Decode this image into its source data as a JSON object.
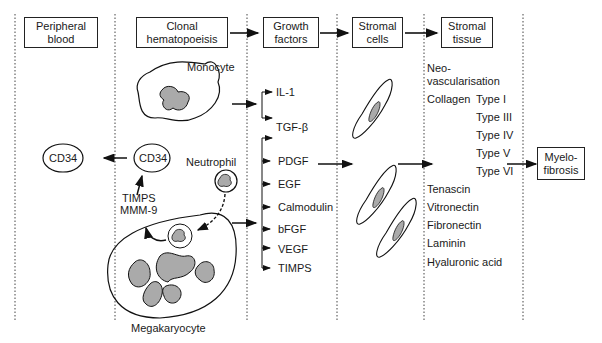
{
  "headers": [
    {
      "id": "peripheral-blood",
      "line1": "Peripheral",
      "line2": "blood"
    },
    {
      "id": "clonal-hematopoeisis",
      "line1": "Clonal",
      "line2": "hematopoeisis"
    },
    {
      "id": "growth-factors",
      "line1": "Growth",
      "line2": "factors"
    },
    {
      "id": "stromal-cells",
      "line1": "Stromal",
      "line2": "cells"
    },
    {
      "id": "stromal-tissue",
      "line1": "Stromal",
      "line2": "tissue"
    }
  ],
  "cells": {
    "monocyte": "Monocyte",
    "neutrophil": "Neutrophil",
    "megakaryocyte": "Megakaryocyte",
    "cd34_clonal": "CD34",
    "cd34_blood": "CD34",
    "timps": "TIMPS",
    "mmm9": "MMM-9"
  },
  "growth_factors": [
    "IL-1",
    "TGF-β",
    "PDGF",
    "EGF",
    "Calmodulin",
    "bFGF",
    "VEGF",
    "TIMPS"
  ],
  "stromal_tissue": {
    "neo1": "Neo-",
    "neo2": "vascularisation",
    "collagen": "Collagen",
    "types": [
      "Type I",
      "Type III",
      "Type IV",
      "Type V",
      "Type VI"
    ],
    "others": [
      "Tenascin",
      "Vitronectin",
      "Fibronectin",
      "Laminin",
      "Hyaluronic acid"
    ]
  },
  "outcome": {
    "line1": "Myelo-",
    "line2": "fibrosis"
  }
}
